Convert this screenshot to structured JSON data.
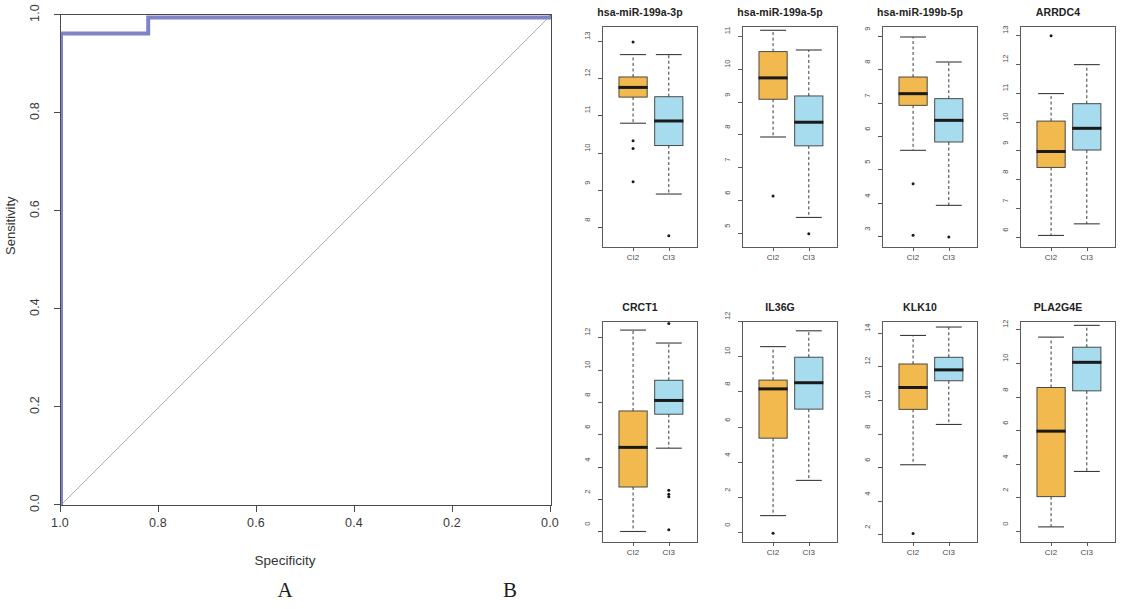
{
  "figure": {
    "panel_a_label": "A",
    "panel_b_label": "B"
  },
  "chart_data": [
    {
      "type": "line",
      "name": "roc-curve",
      "title": "",
      "xlabel": "Specificity",
      "ylabel": "Sensitivity",
      "xlim": [
        1.0,
        0.0
      ],
      "ylim": [
        0.0,
        1.0
      ],
      "x_ticks": [
        "1.0",
        "0.8",
        "0.6",
        "0.4",
        "0.2",
        "0.0"
      ],
      "x_tick_values": [
        1.0,
        0.8,
        0.6,
        0.4,
        0.2,
        0.0
      ],
      "y_ticks": [
        "0.0",
        "0.2",
        "0.4",
        "0.6",
        "0.8",
        "1.0"
      ],
      "y_tick_values": [
        0.0,
        0.2,
        0.4,
        0.6,
        0.8,
        1.0
      ],
      "grid": false,
      "legend": "none",
      "curve_color": "#7f83c8",
      "diagonal_color": "#9a9a9a",
      "series": [
        {
          "name": "ROC",
          "points": [
            [
              1.0,
              0.0
            ],
            [
              1.0,
              0.962
            ],
            [
              0.822,
              0.962
            ],
            [
              0.822,
              0.995
            ],
            [
              0.0,
              0.995
            ],
            [
              0.0,
              1.0
            ]
          ]
        },
        {
          "name": "chance-diagonal",
          "points": [
            [
              1.0,
              0.0
            ],
            [
              0.0,
              1.0
            ]
          ]
        }
      ]
    },
    {
      "type": "box",
      "name": "hsa-miR-199a-3p",
      "title": "hsa-miR-199a-3p",
      "ylim": [
        7.5,
        13.4
      ],
      "y_ticks": [
        "13",
        "12",
        "11",
        "10",
        "9",
        "8"
      ],
      "y_tick_values": [
        13,
        12,
        11,
        10,
        9,
        8
      ],
      "categories": [
        "CI2",
        "CI3"
      ],
      "boxes": [
        {
          "group": "CI2",
          "color": "#f2b94f",
          "lower_whisker": 10.82,
          "q1": 11.52,
          "median": 11.78,
          "q3": 12.06,
          "upper_whisker": 12.66,
          "outliers": [
            13.0,
            10.35,
            10.14,
            9.25
          ]
        },
        {
          "group": "CI3",
          "color": "#a6dcee",
          "lower_whisker": 8.92,
          "q1": 10.22,
          "median": 10.88,
          "q3": 11.53,
          "upper_whisker": 12.66,
          "outliers": [
            7.8
          ]
        }
      ]
    },
    {
      "type": "box",
      "name": "hsa-miR-199a-5p",
      "title": "hsa-miR-199a-5p",
      "ylim": [
        4.6,
        11.3
      ],
      "y_ticks": [
        "11",
        "10",
        "9",
        "8",
        "7",
        "6",
        "5"
      ],
      "y_tick_values": [
        11,
        10,
        9,
        8,
        7,
        6,
        5
      ],
      "categories": [
        "CI2",
        "CI3"
      ],
      "boxes": [
        {
          "group": "CI2",
          "color": "#f2b94f",
          "lower_whisker": 7.95,
          "q1": 9.1,
          "median": 9.75,
          "q3": 10.55,
          "upper_whisker": 11.2,
          "outliers": [
            6.15
          ]
        },
        {
          "group": "CI3",
          "color": "#a6dcee",
          "lower_whisker": 5.5,
          "q1": 7.68,
          "median": 8.4,
          "q3": 9.2,
          "upper_whisker": 10.6,
          "outliers": [
            5.0
          ]
        }
      ]
    },
    {
      "type": "box",
      "name": "hsa-miR-199b-5p",
      "title": "hsa-miR-199b-5p",
      "ylim": [
        2.7,
        9.3
      ],
      "y_ticks": [
        "9",
        "8",
        "7",
        "6",
        "5",
        "4",
        "3"
      ],
      "y_tick_values": [
        9,
        8,
        7,
        6,
        5,
        4,
        3
      ],
      "categories": [
        "CI2",
        "CI3"
      ],
      "boxes": [
        {
          "group": "CI2",
          "color": "#f2b94f",
          "lower_whisker": 5.6,
          "q1": 6.95,
          "median": 7.3,
          "q3": 7.8,
          "upper_whisker": 9.0,
          "outliers": [
            4.6,
            3.05
          ]
        },
        {
          "group": "CI3",
          "color": "#a6dcee",
          "lower_whisker": 3.95,
          "q1": 5.85,
          "median": 6.5,
          "q3": 7.15,
          "upper_whisker": 8.25,
          "outliers": [
            3.0
          ]
        }
      ]
    },
    {
      "type": "box",
      "name": "ARRDC4",
      "title": "ARRDC4",
      "ylim": [
        5.7,
        13.3
      ],
      "y_ticks": [
        "13",
        "12",
        "11",
        "10",
        "9",
        "8",
        "7",
        "6"
      ],
      "y_tick_values": [
        13,
        12,
        11,
        10,
        9,
        8,
        7,
        6
      ],
      "categories": [
        "CI2",
        "CI3"
      ],
      "boxes": [
        {
          "group": "CI2",
          "color": "#f2b94f",
          "lower_whisker": 6.1,
          "q1": 8.45,
          "median": 9.0,
          "q3": 10.05,
          "upper_whisker": 11.0,
          "outliers": [
            13.0
          ]
        },
        {
          "group": "CI3",
          "color": "#a6dcee",
          "lower_whisker": 6.5,
          "q1": 9.05,
          "median": 9.8,
          "q3": 10.65,
          "upper_whisker": 12.0,
          "outliers": []
        }
      ]
    },
    {
      "type": "box",
      "name": "CRCT1",
      "title": "CRCT1",
      "ylim": [
        -0.6,
        13.0
      ],
      "y_ticks": [
        "12",
        "10",
        "8",
        "6",
        "4",
        "2",
        "0"
      ],
      "y_tick_values": [
        12,
        10,
        8,
        6,
        4,
        2,
        0
      ],
      "categories": [
        "CI2",
        "CI3"
      ],
      "boxes": [
        {
          "group": "CI2",
          "color": "#f2b94f",
          "lower_whisker": 0.05,
          "q1": 2.8,
          "median": 5.25,
          "q3": 7.5,
          "upper_whisker": 12.5,
          "outliers": []
        },
        {
          "group": "CI3",
          "color": "#a6dcee",
          "lower_whisker": 5.2,
          "q1": 7.3,
          "median": 8.15,
          "q3": 9.4,
          "upper_whisker": 11.7,
          "outliers": [
            12.9,
            2.6,
            2.35,
            2.2,
            0.15
          ]
        }
      ]
    },
    {
      "type": "box",
      "name": "IL36G",
      "title": "IL36G",
      "ylim": [
        -0.5,
        12.0
      ],
      "y_ticks": [
        "12",
        "10",
        "8",
        "6",
        "4",
        "2",
        "0"
      ],
      "y_tick_values": [
        12,
        10,
        8,
        6,
        4,
        2,
        0
      ],
      "categories": [
        "CI2",
        "CI3"
      ],
      "boxes": [
        {
          "group": "CI2",
          "color": "#f2b94f",
          "lower_whisker": 1.0,
          "q1": 5.4,
          "median": 8.2,
          "q3": 8.7,
          "upper_whisker": 10.6,
          "outliers": [
            0.0
          ]
        },
        {
          "group": "CI3",
          "color": "#a6dcee",
          "lower_whisker": 3.0,
          "q1": 7.05,
          "median": 8.55,
          "q3": 10.0,
          "upper_whisker": 11.5,
          "outliers": []
        }
      ]
    },
    {
      "type": "box",
      "name": "KLK10",
      "title": "KLK10",
      "ylim": [
        1.6,
        14.7
      ],
      "y_ticks": [
        "14",
        "12",
        "10",
        "8",
        "6",
        "4",
        "2"
      ],
      "y_tick_values": [
        14,
        12,
        10,
        8,
        6,
        4,
        2
      ],
      "categories": [
        "CI2",
        "CI3"
      ],
      "boxes": [
        {
          "group": "CI2",
          "color": "#f2b94f",
          "lower_whisker": 6.2,
          "q1": 9.5,
          "median": 10.8,
          "q3": 12.2,
          "upper_whisker": 13.9,
          "outliers": [
            2.1
          ]
        },
        {
          "group": "CI3",
          "color": "#a6dcee",
          "lower_whisker": 8.6,
          "q1": 11.2,
          "median": 11.85,
          "q3": 12.6,
          "upper_whisker": 14.4,
          "outliers": []
        }
      ]
    },
    {
      "type": "box",
      "name": "PLA2G4E",
      "title": "PLA2G4E",
      "ylim": [
        -0.6,
        12.5
      ],
      "y_ticks": [
        "12",
        "10",
        "8",
        "6",
        "4",
        "2",
        "0"
      ],
      "y_tick_values": [
        12,
        10,
        8,
        6,
        4,
        2,
        0
      ],
      "categories": [
        "CI2",
        "CI3"
      ],
      "boxes": [
        {
          "group": "CI2",
          "color": "#f2b94f",
          "lower_whisker": 0.3,
          "q1": 2.1,
          "median": 6.0,
          "q3": 8.6,
          "upper_whisker": 11.6,
          "outliers": []
        },
        {
          "group": "CI3",
          "color": "#a6dcee",
          "lower_whisker": 3.6,
          "q1": 8.4,
          "median": 10.1,
          "q3": 11.0,
          "upper_whisker": 12.3,
          "outliers": []
        }
      ]
    }
  ]
}
